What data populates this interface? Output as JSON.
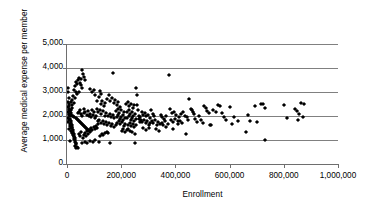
{
  "chart_data": {
    "type": "scatter",
    "title": "",
    "xlabel": "Enrollment",
    "ylabel": "Average medical expense per member",
    "xlim": [
      0,
      1000000
    ],
    "ylim": [
      0,
      5000
    ],
    "grid": true,
    "legend": null,
    "xticks": [
      0,
      200000,
      400000,
      600000,
      800000,
      1000000
    ],
    "xtick_labels": [
      "0",
      "200,000",
      "400,000",
      "600,000",
      "800,000",
      "1,000,000"
    ],
    "yticks": [
      0,
      1000,
      2000,
      3000,
      4000,
      5000
    ],
    "ytick_labels": [
      "0",
      "1,000",
      "2,000",
      "3,000",
      "4,000",
      "5,000"
    ],
    "marker": "diamond",
    "marker_color": "#000000",
    "gridline_color": "#808080",
    "points": [
      [
        3000,
        3180
      ],
      [
        5000,
        2980
      ],
      [
        6000,
        2760
      ],
      [
        7000,
        2520
      ],
      [
        4000,
        2380
      ],
      [
        8000,
        2300
      ],
      [
        3500,
        2180
      ],
      [
        9000,
        2100
      ],
      [
        6500,
        2040
      ],
      [
        11000,
        1980
      ],
      [
        4500,
        1920
      ],
      [
        12000,
        1880
      ],
      [
        7500,
        1840
      ],
      [
        14000,
        1800
      ],
      [
        5500,
        1760
      ],
      [
        15000,
        1720
      ],
      [
        9500,
        1680
      ],
      [
        17000,
        1640
      ],
      [
        10500,
        1600
      ],
      [
        18000,
        1560
      ],
      [
        13000,
        1520
      ],
      [
        20000,
        1480
      ],
      [
        8500,
        1440
      ],
      [
        21000,
        1400
      ],
      [
        16000,
        1360
      ],
      [
        23000,
        1320
      ],
      [
        19000,
        1280
      ],
      [
        24000,
        1240
      ],
      [
        22000,
        1200
      ],
      [
        26000,
        1160
      ],
      [
        25000,
        1120
      ],
      [
        28000,
        1080
      ],
      [
        27000,
        1040
      ],
      [
        30000,
        1000
      ],
      [
        12500,
        960
      ],
      [
        31000,
        900
      ],
      [
        33000,
        860
      ],
      [
        35000,
        820
      ],
      [
        29000,
        760
      ],
      [
        37000,
        700
      ],
      [
        40000,
        680
      ],
      [
        34000,
        660
      ],
      [
        16500,
        2600
      ],
      [
        18500,
        2680
      ],
      [
        22000,
        2820
      ],
      [
        26000,
        3100
      ],
      [
        30000,
        3260
      ],
      [
        33000,
        3400
      ],
      [
        36000,
        3320
      ],
      [
        40000,
        3480
      ],
      [
        44000,
        3600
      ],
      [
        47000,
        3380
      ],
      [
        50000,
        3300
      ],
      [
        53000,
        3540
      ],
      [
        57000,
        3930
      ],
      [
        60000,
        3760
      ],
      [
        63000,
        3620
      ],
      [
        66000,
        3500
      ],
      [
        54000,
        3180
      ],
      [
        46000,
        3020
      ],
      [
        38000,
        2900
      ],
      [
        32000,
        2980
      ],
      [
        28000,
        2740
      ],
      [
        24000,
        2560
      ],
      [
        20000,
        2440
      ],
      [
        17000,
        2340
      ],
      [
        14000,
        2260
      ],
      [
        11000,
        2200
      ],
      [
        9000,
        2260
      ],
      [
        7000,
        2420
      ],
      [
        5000,
        2600
      ],
      [
        13000,
        2120
      ],
      [
        15500,
        2060
      ],
      [
        19500,
        2020
      ],
      [
        23500,
        1980
      ],
      [
        27500,
        1940
      ],
      [
        31500,
        1900
      ],
      [
        35500,
        1860
      ],
      [
        39500,
        1820
      ],
      [
        43500,
        1780
      ],
      [
        47500,
        1740
      ],
      [
        51500,
        1700
      ],
      [
        55500,
        1660
      ],
      [
        59500,
        1620
      ],
      [
        63500,
        1580
      ],
      [
        67500,
        1540
      ],
      [
        71500,
        1500
      ],
      [
        75500,
        1460
      ],
      [
        79500,
        1420
      ],
      [
        83500,
        1380
      ],
      [
        41000,
        2140
      ],
      [
        45000,
        2180
      ],
      [
        49000,
        2240
      ],
      [
        52000,
        2080
      ],
      [
        56000,
        2000
      ],
      [
        61000,
        2120
      ],
      [
        64000,
        2280
      ],
      [
        68000,
        2160
      ],
      [
        72000,
        2060
      ],
      [
        76000,
        2200
      ],
      [
        80000,
        2020
      ],
      [
        84000,
        2100
      ],
      [
        88000,
        1960
      ],
      [
        92000,
        2240
      ],
      [
        96000,
        2060
      ],
      [
        100000,
        2180
      ],
      [
        104000,
        1900
      ],
      [
        108000,
        2020
      ],
      [
        44000,
        1260
      ],
      [
        48000,
        1180
      ],
      [
        52000,
        1340
      ],
      [
        58000,
        1100
      ],
      [
        62000,
        1220
      ],
      [
        66000,
        1300
      ],
      [
        70000,
        1160
      ],
      [
        74000,
        1380
      ],
      [
        78000,
        1240
      ],
      [
        82000,
        1420
      ],
      [
        86000,
        1320
      ],
      [
        90000,
        1480
      ],
      [
        94000,
        1400
      ],
      [
        98000,
        1540
      ],
      [
        103000,
        1460
      ],
      [
        107000,
        1600
      ],
      [
        112000,
        1520
      ],
      [
        116000,
        1660
      ],
      [
        55000,
        880
      ],
      [
        65000,
        920
      ],
      [
        75000,
        860
      ],
      [
        85000,
        960
      ],
      [
        95000,
        900
      ],
      [
        105000,
        1020
      ],
      [
        86000,
        3120
      ],
      [
        92000,
        2980
      ],
      [
        98000,
        3080
      ],
      [
        105000,
        2860
      ],
      [
        112000,
        2640
      ],
      [
        118000,
        2780
      ],
      [
        124000,
        2500
      ],
      [
        130000,
        2620
      ],
      [
        136000,
        2420
      ],
      [
        142000,
        2560
      ],
      [
        120000,
        3040
      ],
      [
        126000,
        2900
      ],
      [
        110000,
        2300
      ],
      [
        115000,
        2160
      ],
      [
        121000,
        2240
      ],
      [
        127000,
        2080
      ],
      [
        133000,
        2200
      ],
      [
        139000,
        2020
      ],
      [
        145000,
        2140
      ],
      [
        151000,
        1980
      ],
      [
        157000,
        2100
      ],
      [
        163000,
        1940
      ],
      [
        169000,
        2060
      ],
      [
        175000,
        1900
      ],
      [
        113000,
        1780
      ],
      [
        119000,
        1840
      ],
      [
        125000,
        1720
      ],
      [
        131000,
        1800
      ],
      [
        137000,
        1680
      ],
      [
        143000,
        1760
      ],
      [
        149000,
        1640
      ],
      [
        155000,
        1720
      ],
      [
        161000,
        1600
      ],
      [
        167000,
        1680
      ],
      [
        173000,
        1560
      ],
      [
        179000,
        1640
      ],
      [
        128000,
        1240
      ],
      [
        134000,
        1200
      ],
      [
        140000,
        1280
      ],
      [
        122000,
        1160
      ],
      [
        146000,
        1340
      ],
      [
        152000,
        1300
      ],
      [
        117000,
        900
      ],
      [
        158000,
        870
      ],
      [
        148000,
        2720
      ],
      [
        154000,
        2880
      ],
      [
        160000,
        2640
      ],
      [
        166000,
        2760
      ],
      [
        170000,
        3800
      ],
      [
        172000,
        2560
      ],
      [
        178000,
        2680
      ],
      [
        184000,
        2460
      ],
      [
        190000,
        2580
      ],
      [
        196000,
        2380
      ],
      [
        181000,
        2220
      ],
      [
        187000,
        2300
      ],
      [
        193000,
        2140
      ],
      [
        199000,
        2260
      ],
      [
        205000,
        2060
      ],
      [
        211000,
        2180
      ],
      [
        183000,
        1960
      ],
      [
        189000,
        2040
      ],
      [
        195000,
        1880
      ],
      [
        201000,
        1960
      ],
      [
        207000,
        1820
      ],
      [
        213000,
        1900
      ],
      [
        185000,
        1720
      ],
      [
        191000,
        1780
      ],
      [
        197000,
        1660
      ],
      [
        203000,
        1740
      ],
      [
        209000,
        1580
      ],
      [
        215000,
        1660
      ],
      [
        202000,
        1380
      ],
      [
        208000,
        1440
      ],
      [
        214000,
        1320
      ],
      [
        220000,
        1400
      ],
      [
        226000,
        1460
      ],
      [
        232000,
        1360
      ],
      [
        218000,
        2480
      ],
      [
        224000,
        2600
      ],
      [
        230000,
        2400
      ],
      [
        236000,
        2520
      ],
      [
        242000,
        2320
      ],
      [
        248000,
        2440
      ],
      [
        221000,
        2160
      ],
      [
        227000,
        2240
      ],
      [
        233000,
        2080
      ],
      [
        239000,
        2160
      ],
      [
        245000,
        2000
      ],
      [
        251000,
        2100
      ],
      [
        223000,
        1900
      ],
      [
        229000,
        1980
      ],
      [
        235000,
        1840
      ],
      [
        241000,
        1920
      ],
      [
        247000,
        1780
      ],
      [
        253000,
        1860
      ],
      [
        225000,
        1640
      ],
      [
        231000,
        1700
      ],
      [
        237000,
        1580
      ],
      [
        243000,
        1660
      ],
      [
        249000,
        1540
      ],
      [
        255000,
        1620
      ],
      [
        240000,
        1320
      ],
      [
        250000,
        1260
      ],
      [
        256000,
        3180
      ],
      [
        258000,
        2880
      ],
      [
        260000,
        2460
      ],
      [
        262000,
        2240
      ],
      [
        252000,
        870
      ],
      [
        264000,
        2020
      ],
      [
        266000,
        1860
      ],
      [
        268000,
        1940
      ],
      [
        270000,
        1760
      ],
      [
        272000,
        1840
      ],
      [
        275000,
        2180
      ],
      [
        281000,
        2060
      ],
      [
        287000,
        2140
      ],
      [
        293000,
        1980
      ],
      [
        299000,
        2060
      ],
      [
        305000,
        1900
      ],
      [
        278000,
        1760
      ],
      [
        284000,
        1840
      ],
      [
        290000,
        1700
      ],
      [
        296000,
        1780
      ],
      [
        302000,
        1640
      ],
      [
        308000,
        1720
      ],
      [
        280000,
        1480
      ],
      [
        292000,
        1420
      ],
      [
        304000,
        1500
      ],
      [
        310000,
        2240
      ],
      [
        316000,
        2100
      ],
      [
        322000,
        1980
      ],
      [
        313000,
        1780
      ],
      [
        319000,
        1700
      ],
      [
        325000,
        1840
      ],
      [
        331000,
        1620
      ],
      [
        337000,
        1760
      ],
      [
        343000,
        1660
      ],
      [
        328000,
        1440
      ],
      [
        340000,
        1380
      ],
      [
        346000,
        2060
      ],
      [
        352000,
        1940
      ],
      [
        358000,
        1860
      ],
      [
        364000,
        1980
      ],
      [
        349000,
        1700
      ],
      [
        355000,
        1620
      ],
      [
        361000,
        1780
      ],
      [
        367000,
        1560
      ],
      [
        373000,
        1680
      ],
      [
        375000,
        3700
      ],
      [
        380000,
        2280
      ],
      [
        388000,
        2120
      ],
      [
        396000,
        2180
      ],
      [
        404000,
        2040
      ],
      [
        412000,
        1960
      ],
      [
        420000,
        2100
      ],
      [
        384000,
        1820
      ],
      [
        392000,
        1740
      ],
      [
        400000,
        1880
      ],
      [
        408000,
        1660
      ],
      [
        416000,
        1800
      ],
      [
        424000,
        1720
      ],
      [
        390000,
        1440
      ],
      [
        410000,
        1780
      ],
      [
        428000,
        2160
      ],
      [
        436000,
        2020
      ],
      [
        444000,
        1940
      ],
      [
        452000,
        2720
      ],
      [
        440000,
        1260
      ],
      [
        448000,
        1840
      ],
      [
        456000,
        2300
      ],
      [
        460000,
        2240
      ],
      [
        464000,
        2180
      ],
      [
        468000,
        2100
      ],
      [
        472000,
        1860
      ],
      [
        480000,
        1760
      ],
      [
        488000,
        1980
      ],
      [
        496000,
        1820
      ],
      [
        504000,
        2400
      ],
      [
        512000,
        2340
      ],
      [
        500000,
        1700
      ],
      [
        516000,
        2200
      ],
      [
        524000,
        2120
      ],
      [
        532000,
        1620
      ],
      [
        540000,
        2260
      ],
      [
        548000,
        2160
      ],
      [
        528000,
        1640
      ],
      [
        556000,
        2460
      ],
      [
        564000,
        2400
      ],
      [
        572000,
        2120
      ],
      [
        580000,
        1960
      ],
      [
        588000,
        1840
      ],
      [
        600000,
        2380
      ],
      [
        608000,
        1680
      ],
      [
        616000,
        1940
      ],
      [
        630000,
        1790
      ],
      [
        660000,
        1340
      ],
      [
        668000,
        2060
      ],
      [
        676000,
        1800
      ],
      [
        692000,
        2400
      ],
      [
        700000,
        1760
      ],
      [
        716000,
        2520
      ],
      [
        724000,
        2480
      ],
      [
        732000,
        2340
      ],
      [
        730000,
        1000
      ],
      [
        800000,
        2440
      ],
      [
        812000,
        1900
      ],
      [
        840000,
        2300
      ],
      [
        848000,
        2220
      ],
      [
        852000,
        1820
      ],
      [
        856000,
        2080
      ],
      [
        864000,
        2560
      ],
      [
        872000,
        1940
      ],
      [
        876000,
        2500
      ]
    ]
  },
  "axis": {
    "y_title": "Average medical expense per member",
    "x_title": "Enrollment"
  }
}
